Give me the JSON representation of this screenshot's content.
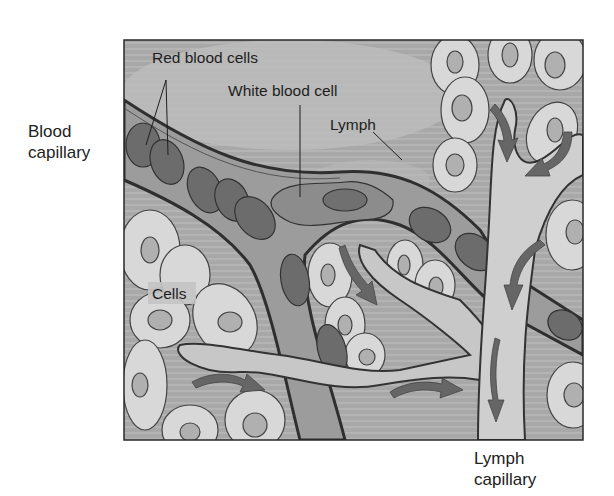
{
  "figure": {
    "external_labels": {
      "blood_capillary_line1": "Blood",
      "blood_capillary_line2": "capillary",
      "lymph_capillary_line1": "Lymph",
      "lymph_capillary_line2": "capillary"
    },
    "internal_labels": {
      "red_blood_cells": "Red blood cells",
      "white_blood_cell": "White blood cell",
      "lymph": "Lymph",
      "cells": "Cells"
    },
    "colors": {
      "background": "#9a9a9a",
      "interstitial_light": "#b8b8b8",
      "tissue_cell": "#d6d6d6",
      "tissue_nucleus": "#b3b3b3",
      "red_blood_cell": "#6e6e6e",
      "capillary_wall": "#3a3a3a",
      "lymph_vessel": "#cfcfcf",
      "arrow": "#6a6a6a",
      "frame": "#2a2a2a"
    }
  }
}
